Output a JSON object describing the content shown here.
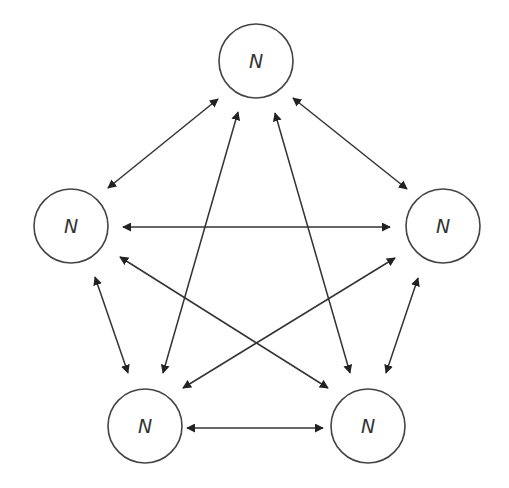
{
  "diagram": {
    "type": "complete-graph",
    "node_label": "N",
    "colors": {
      "edge": "#333333",
      "node_stroke": "#444444",
      "label": "#333333",
      "background": "#ffffff"
    },
    "nodes": [
      {
        "id": "top",
        "label": "N",
        "cx": 256,
        "cy": 61,
        "r": 37
      },
      {
        "id": "left",
        "label": "N",
        "cx": 71,
        "cy": 226,
        "r": 37
      },
      {
        "id": "right",
        "label": "N",
        "cx": 443,
        "cy": 226,
        "r": 37
      },
      {
        "id": "bottom-left",
        "label": "N",
        "cx": 145,
        "cy": 426,
        "r": 37
      },
      {
        "id": "bottom-right",
        "label": "N",
        "cx": 368,
        "cy": 426,
        "r": 37
      }
    ],
    "edges": [
      {
        "from": "top",
        "to": "left",
        "bidirectional": true,
        "x1": 218,
        "y1": 99,
        "x2": 108,
        "y2": 188
      },
      {
        "from": "top",
        "to": "right",
        "bidirectional": true,
        "x1": 293,
        "y1": 98,
        "x2": 407,
        "y2": 189
      },
      {
        "from": "left",
        "to": "right",
        "bidirectional": true,
        "x1": 123,
        "y1": 227,
        "x2": 390,
        "y2": 227
      },
      {
        "from": "top",
        "to": "bottom-left",
        "bidirectional": true,
        "x1": 238,
        "y1": 112,
        "x2": 163,
        "y2": 373
      },
      {
        "from": "top",
        "to": "bottom-right",
        "bidirectional": true,
        "x1": 275,
        "y1": 113,
        "x2": 350,
        "y2": 373
      },
      {
        "from": "left",
        "to": "bottom-left",
        "bidirectional": true,
        "x1": 95,
        "y1": 277,
        "x2": 128,
        "y2": 373
      },
      {
        "from": "right",
        "to": "bottom-right",
        "bidirectional": true,
        "x1": 418,
        "y1": 278,
        "x2": 386,
        "y2": 373
      },
      {
        "from": "left",
        "to": "bottom-right",
        "bidirectional": true,
        "x1": 120,
        "y1": 257,
        "x2": 328,
        "y2": 388
      },
      {
        "from": "right",
        "to": "bottom-left",
        "bidirectional": true,
        "x1": 395,
        "y1": 258,
        "x2": 183,
        "y2": 388
      },
      {
        "from": "bottom-left",
        "to": "bottom-right",
        "bidirectional": true,
        "x1": 187,
        "y1": 428,
        "x2": 323,
        "y2": 428
      }
    ]
  }
}
